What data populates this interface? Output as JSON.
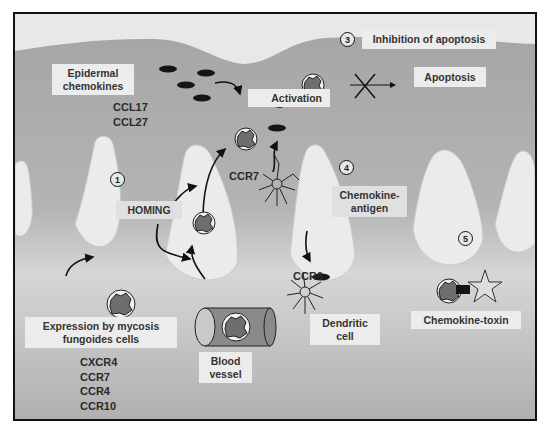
{
  "figure": {
    "steps": [
      {
        "number": "1",
        "label": "HOMING"
      },
      {
        "number": "2",
        "label": "Activation"
      },
      {
        "number": "3",
        "label": "Inhibition of apoptosis"
      },
      {
        "number": "4",
        "label": "Chemokine-\nantigen"
      },
      {
        "number": "5",
        "label": "Chemokine-toxin"
      }
    ],
    "labels": {
      "epidermal_chemokines": "Epidermal chemokines",
      "epidermal_line1": "Epidermal",
      "epidermal_line2": "chemokines",
      "apoptosis": "Apoptosis",
      "chemokine_antigen_line1": "Chemokine-",
      "chemokine_antigen_line2": "antigen",
      "dendritic_line1": "Dendritic",
      "dendritic_line2": "cell",
      "blood_line1": "Blood",
      "blood_line2": "vessel",
      "expression_line1": "Expression by mycosis",
      "expression_line2": "fungoides cells"
    },
    "epidermal_chemokine_list": [
      "CCL17",
      "CCL27"
    ],
    "receptor_list": [
      "CXCR4",
      "CCR7",
      "CCR4",
      "CCR10"
    ],
    "receptor_tags": {
      "dendritic_ccr7": "CCR7",
      "dendritic_ccr6": "CCR6"
    },
    "colors": {
      "background_light": "#e6e6e6",
      "tissue_gray": "#a9a9a9",
      "cell_dark": "#6e6e6e",
      "chemokine_black": "#151515",
      "border": "#111111"
    }
  }
}
